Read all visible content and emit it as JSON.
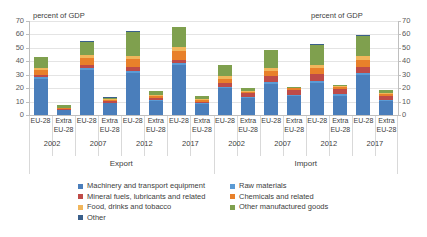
{
  "axis": {
    "title_left": "percent of GDP",
    "title_right": "percent of GDP",
    "yticks": [
      "0",
      "10",
      "20",
      "30",
      "40",
      "50",
      "60",
      "70"
    ]
  },
  "groups": [
    {
      "label": "Export"
    },
    {
      "label": "Import"
    }
  ],
  "years": [
    "2002",
    "2007",
    "2012",
    "2017",
    "2002",
    "2007",
    "2012",
    "2017"
  ],
  "categories": [
    {
      "l1": "EU-28",
      "l2": ""
    },
    {
      "l1": "Extra",
      "l2": "EU-28"
    },
    {
      "l1": "EU-28",
      "l2": ""
    },
    {
      "l1": "Extra",
      "l2": "EU-28"
    },
    {
      "l1": "EU-28",
      "l2": ""
    },
    {
      "l1": "Extra",
      "l2": "EU-28"
    },
    {
      "l1": "EU-28",
      "l2": ""
    },
    {
      "l1": "Extra",
      "l2": "EU-28"
    },
    {
      "l1": "EU-28",
      "l2": ""
    },
    {
      "l1": "Extra",
      "l2": "EU-28"
    },
    {
      "l1": "EU-28",
      "l2": ""
    },
    {
      "l1": "Extra",
      "l2": "EU-28"
    },
    {
      "l1": "EU-28",
      "l2": ""
    },
    {
      "l1": "Extra",
      "l2": "EU-28"
    },
    {
      "l1": "EU-28",
      "l2": ""
    },
    {
      "l1": "Extra",
      "l2": "EU-28"
    }
  ],
  "legend": [
    {
      "label": "Machinery and transport equipment",
      "color": "#4a7ebb"
    },
    {
      "label": "Raw materials",
      "color": "#5b9bd5"
    },
    {
      "label": "Mineral fuels, lubricants and related",
      "color": "#be4b48"
    },
    {
      "label": "Chemicals and related",
      "color": "#e8802a"
    },
    {
      "label": "Food, drinks and tobacco",
      "color": "#f1b65b"
    },
    {
      "label": "Other manufactured goods",
      "color": "#7fa04e"
    },
    {
      "label": "Other",
      "color": "#3a5f8a"
    }
  ],
  "chart_data": {
    "type": "bar",
    "subtype": "stacked-column",
    "title": "",
    "xlabel": "",
    "ylabel": "percent of GDP",
    "ylim": [
      0,
      70
    ],
    "ytick_step": 10,
    "grid": true,
    "legend_position": "bottom",
    "series": [
      {
        "name": "Machinery and transport equipment",
        "color": "#4a7ebb",
        "values": [
          27,
          3.5,
          33.5,
          8.8,
          31.5,
          10.8,
          37,
          8.2,
          20,
          13,
          23,
          14,
          23.5,
          14.5,
          30,
          10.5
        ]
      },
      {
        "name": "Raw materials",
        "color": "#5b9bd5",
        "values": [
          1.2,
          0.3,
          1.5,
          0.4,
          1.5,
          0.5,
          1.5,
          0.4,
          1.2,
          0.6,
          1.5,
          0.8,
          1.5,
          0.8,
          1.5,
          0.7
        ]
      },
      {
        "name": "Mineral fuels, lubricants and related",
        "color": "#be4b48",
        "values": [
          1.5,
          0.5,
          2.5,
          1.0,
          3.0,
          1.3,
          2.5,
          0.9,
          3.0,
          2.5,
          4.5,
          3.5,
          5.5,
          4.0,
          4.0,
          2.8
        ]
      },
      {
        "name": "Chemicals and related",
        "color": "#e8802a",
        "values": [
          3.5,
          0.8,
          5.0,
          1.2,
          5.5,
          1.6,
          6.5,
          1.5,
          3.0,
          1.2,
          4.0,
          1.5,
          4.5,
          1.7,
          5.5,
          1.6
        ]
      },
      {
        "name": "Food, drinks and tobacco",
        "color": "#f1b65b",
        "values": [
          1.5,
          0.4,
          2.0,
          0.5,
          2.5,
          0.6,
          3.0,
          0.6,
          1.8,
          0.5,
          2.2,
          0.6,
          2.5,
          0.7,
          3.0,
          0.7
        ]
      },
      {
        "name": "Other manufactured goods",
        "color": "#7fa04e",
        "values": [
          8.5,
          1.8,
          10.0,
          1.1,
          18.0,
          3.0,
          15.0,
          2.7,
          8.0,
          2.0,
          13.0,
          0.6,
          15.0,
          0.8,
          15.0,
          2.2
        ]
      },
      {
        "name": "Other",
        "color": "#3a5f8a",
        "values": [
          0.3,
          0.1,
          0.3,
          0.1,
          0.3,
          0.1,
          0.3,
          0.1,
          0.3,
          0.1,
          0.3,
          0.1,
          0.3,
          0.1,
          0.3,
          0.1
        ]
      }
    ],
    "totals": [
      43.5,
      7.4,
      54.8,
      13.1,
      62.3,
      17.9,
      65.8,
      14.4,
      37.3,
      19.9,
      48.5,
      21.1,
      52.8,
      22.6,
      59.3,
      18.6
    ],
    "x_major_labels": [
      "Export",
      "Import"
    ],
    "x_year_labels": [
      "2002",
      "2007",
      "2012",
      "2017",
      "2002",
      "2007",
      "2012",
      "2017"
    ],
    "x_sub_labels": [
      "EU-28",
      "Extra EU-28",
      "EU-28",
      "Extra EU-28",
      "EU-28",
      "Extra EU-28",
      "EU-28",
      "Extra EU-28",
      "EU-28",
      "Extra EU-28",
      "EU-28",
      "Extra EU-28",
      "EU-28",
      "Extra EU-28",
      "EU-28",
      "Extra EU-28"
    ]
  }
}
